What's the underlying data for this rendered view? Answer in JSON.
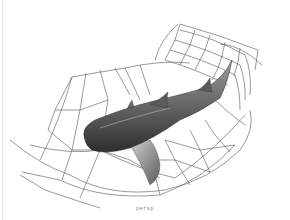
{
  "figure": {
    "caption": "persp",
    "colors": {
      "background": "#ffffff",
      "lattice_stroke": "#555555",
      "shark_dark": "#3a3a3a",
      "shark_mid": "#7a7a7a",
      "shark_light": "#c8c8c8"
    }
  }
}
